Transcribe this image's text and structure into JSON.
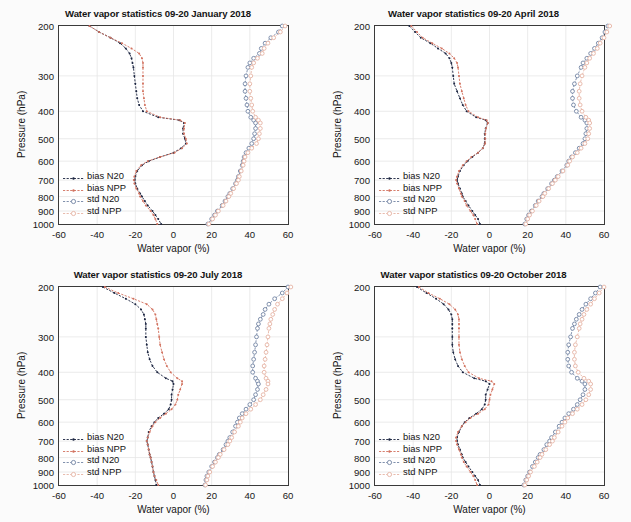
{
  "figure": {
    "xaxis_title": "Water vapor (%)",
    "yaxis_title": "Pressure (hPa)",
    "xticks": [
      "-60",
      "-40",
      "-20",
      "0",
      "20",
      "40",
      "60"
    ],
    "yticks": [
      "200",
      "300",
      "400",
      "500",
      "600",
      "700",
      "800",
      "900",
      "1000"
    ],
    "legend_labels": [
      "bias N20",
      "bias NPP",
      "std N20",
      "std NPP"
    ]
  },
  "colors": {
    "bias_n20": "#1b2440",
    "bias_npp": "#d2725f",
    "std_n20": "#7385a4",
    "std_npp": "#e5b3a4",
    "axis": "#3a3a3a",
    "grid": "#e6e6e6",
    "text": "#141414",
    "background": "#ffffff"
  },
  "chart_data": [
    {
      "type": "line",
      "title": "Water vapor statistics 09-20 January 2018",
      "xlabel": "Water vapor (%)",
      "ylabel": "Pressure (hPa)",
      "xlim": [
        -60,
        60
      ],
      "ylim": [
        200,
        1000
      ],
      "yscale": "log",
      "grid": true,
      "legend_position": "lower-left",
      "pressure": [
        200,
        210,
        220,
        230,
        240,
        250,
        260,
        270,
        280,
        300,
        320,
        340,
        360,
        380,
        400,
        420,
        430,
        440,
        460,
        480,
        500,
        520,
        540,
        560,
        580,
        600,
        620,
        650,
        680,
        700,
        720,
        750,
        780,
        800,
        830,
        860,
        900,
        930,
        960,
        1000
      ],
      "series": [
        {
          "name": "bias N20",
          "values": [
            -44,
            -39,
            -33,
            -28,
            -25,
            -23,
            -22,
            -21.5,
            -21,
            -20.5,
            -20,
            -19.5,
            -19,
            -18,
            -16,
            -8,
            3,
            5.5,
            5,
            5,
            6,
            6.5,
            4,
            0,
            -7,
            -13,
            -16.5,
            -19,
            -20,
            -20.3,
            -20,
            -19,
            -17.5,
            -16.5,
            -15,
            -13.5,
            -11,
            -9.5,
            -8,
            -6.5
          ]
        },
        {
          "name": "bias NPP",
          "values": [
            -44,
            -39,
            -33,
            -27,
            -22,
            -18,
            -16.5,
            -16,
            -16,
            -16,
            -16,
            -16,
            -15.5,
            -15,
            -14,
            -7,
            3.5,
            6,
            5.5,
            5.5,
            6.5,
            7,
            4.5,
            0.5,
            -7,
            -13.5,
            -17,
            -19.5,
            -20.5,
            -20.8,
            -20.5,
            -19.5,
            -18,
            -17.5,
            -16,
            -14.5,
            -12,
            -10.5,
            -9.5,
            -8.5
          ]
        },
        {
          "name": "std N20",
          "values": [
            57,
            55,
            51,
            48,
            46,
            45,
            42,
            40,
            39,
            38,
            37.5,
            37.5,
            38,
            38.5,
            39,
            40.5,
            42,
            43,
            43,
            42.5,
            42,
            41,
            39.5,
            38,
            37,
            36.5,
            36,
            35,
            34,
            33.5,
            32.5,
            31,
            29.5,
            28.5,
            27,
            25.5,
            23,
            21.5,
            20,
            18
          ]
        },
        {
          "name": "std NPP",
          "values": [
            58.5,
            56,
            52.5,
            49.5,
            47.5,
            46.5,
            44,
            42,
            41,
            40.5,
            40,
            40,
            40.5,
            41,
            41.5,
            43,
            44.5,
            45.5,
            45.5,
            45,
            44.5,
            43.5,
            41,
            39,
            37.5,
            37,
            36.5,
            35.5,
            34.5,
            34,
            33,
            31.5,
            30,
            29,
            27.5,
            26,
            23.5,
            22,
            20.5,
            18.5
          ]
        }
      ]
    },
    {
      "type": "line",
      "title": "Water vapor statistics 09-20 April 2018",
      "xlabel": "Water vapor (%)",
      "ylabel": "Pressure (hPa)",
      "xlim": [
        -60,
        60
      ],
      "ylim": [
        200,
        1000
      ],
      "yscale": "log",
      "grid": true,
      "legend_position": "lower-left",
      "pressure": [
        200,
        210,
        220,
        230,
        240,
        250,
        260,
        270,
        280,
        300,
        320,
        340,
        360,
        380,
        400,
        420,
        430,
        440,
        460,
        480,
        500,
        520,
        540,
        560,
        580,
        600,
        620,
        650,
        680,
        700,
        720,
        750,
        780,
        800,
        830,
        860,
        900,
        930,
        960,
        1000
      ],
      "series": [
        {
          "name": "bias N20",
          "values": [
            -42,
            -39,
            -36,
            -31,
            -27,
            -23,
            -21,
            -20,
            -19.5,
            -19,
            -18.5,
            -17,
            -15.5,
            -14,
            -12,
            -7,
            -2,
            -1,
            -2,
            -2.5,
            -2.5,
            -2.5,
            -3.5,
            -6,
            -9,
            -11.5,
            -13.5,
            -15.5,
            -16.5,
            -17,
            -16.5,
            -15.5,
            -14.5,
            -14,
            -12.5,
            -11,
            -9,
            -7.5,
            -6,
            -5
          ]
        },
        {
          "name": "bias NPP",
          "values": [
            -41,
            -38,
            -35,
            -30,
            -25,
            -21,
            -18.5,
            -17,
            -16.5,
            -16,
            -15.5,
            -14.5,
            -13.5,
            -12.5,
            -11,
            -6,
            -1.5,
            -0.8,
            -1.8,
            -2.2,
            -2.2,
            -2.3,
            -3.5,
            -6,
            -9.5,
            -12,
            -14,
            -16,
            -17,
            -17.5,
            -17,
            -16,
            -15,
            -14.5,
            -13,
            -12,
            -10,
            -8.5,
            -7.5,
            -6.5
          ]
        },
        {
          "name": "std N20",
          "values": [
            62,
            60.5,
            59,
            57,
            55,
            53,
            51,
            49,
            48,
            46,
            44.5,
            43.5,
            43.5,
            44,
            45.5,
            48,
            50,
            51,
            51,
            50.5,
            50,
            49,
            47,
            45,
            43,
            41.5,
            40.5,
            38,
            35.5,
            34,
            32.5,
            30.5,
            28.5,
            27.5,
            25.5,
            24,
            22,
            20.5,
            19.5,
            18.5
          ]
        },
        {
          "name": "std NPP",
          "values": [
            63,
            61.5,
            60,
            58,
            56.5,
            54.5,
            52.5,
            51,
            50,
            48.5,
            47.5,
            47,
            47,
            47.5,
            48.5,
            50.5,
            52,
            52.5,
            52.5,
            52,
            51.5,
            50,
            48,
            46,
            43.5,
            42,
            41,
            38.5,
            36,
            34.5,
            33,
            31,
            29,
            28,
            26,
            24.5,
            22.5,
            21,
            20,
            19
          ]
        }
      ]
    },
    {
      "type": "line",
      "title": "Water vapor statistics 09-20 July 2018",
      "xlabel": "Water vapor (%)",
      "ylabel": "Pressure (hPa)",
      "xlim": [
        -60,
        60
      ],
      "ylim": [
        200,
        1000
      ],
      "yscale": "log",
      "grid": true,
      "legend_position": "lower-left",
      "pressure": [
        200,
        210,
        220,
        230,
        240,
        250,
        260,
        270,
        280,
        300,
        320,
        340,
        360,
        380,
        400,
        420,
        430,
        440,
        460,
        480,
        500,
        520,
        540,
        560,
        580,
        600,
        620,
        650,
        680,
        700,
        720,
        750,
        780,
        800,
        830,
        860,
        900,
        930,
        960,
        1000
      ],
      "series": [
        {
          "name": "bias N20",
          "values": [
            -37,
            -31,
            -25,
            -20,
            -17,
            -15.5,
            -15,
            -14.5,
            -14.5,
            -14.5,
            -14,
            -13.5,
            -12.5,
            -11,
            -8.5,
            -4,
            -0.5,
            0,
            -0.5,
            -1,
            -1,
            -1.5,
            -2.5,
            -5,
            -8,
            -10,
            -11.5,
            -13,
            -13.5,
            -14,
            -13.5,
            -13,
            -12.5,
            -12,
            -11.5,
            -11,
            -10.5,
            -10,
            -9.5,
            -9
          ]
        },
        {
          "name": "bias NPP",
          "values": [
            -36,
            -29,
            -21,
            -14,
            -11,
            -9.5,
            -9,
            -8.5,
            -8,
            -7.5,
            -7,
            -6,
            -5,
            -3.5,
            -1.5,
            2,
            4.5,
            4.5,
            3.5,
            2.5,
            2,
            1,
            -1,
            -4,
            -7,
            -9.5,
            -11,
            -12.5,
            -13.5,
            -14,
            -13.5,
            -13,
            -12.5,
            -12,
            -11.5,
            -11,
            -10.5,
            -10,
            -9,
            -8
          ]
        },
        {
          "name": "std N20",
          "values": [
            60,
            57,
            53,
            50,
            48,
            47,
            45.5,
            44.5,
            44,
            43.5,
            43,
            42.5,
            42,
            41.5,
            41.5,
            43,
            44,
            44.5,
            44,
            43,
            42,
            40,
            38,
            36,
            34.5,
            33.5,
            32.5,
            31,
            29.5,
            28.5,
            27.5,
            26,
            24,
            23,
            21.5,
            20,
            18.5,
            17.5,
            17,
            16.5
          ]
        },
        {
          "name": "std NPP",
          "values": [
            61.5,
            59.5,
            57,
            54.5,
            53,
            52,
            51,
            50.5,
            50,
            49.5,
            49,
            48.5,
            48,
            47.5,
            47.5,
            48.5,
            49.5,
            49.5,
            48.5,
            47,
            45.5,
            43,
            40.5,
            38,
            36,
            35,
            34,
            32,
            30.5,
            29.5,
            28.5,
            26.5,
            24.5,
            23.5,
            22,
            20.5,
            19,
            18,
            17.5,
            16.8
          ]
        }
      ]
    },
    {
      "type": "line",
      "title": "Water vapor statistics 09-20 October 2018",
      "xlabel": "Water vapor (%)",
      "ylabel": "Pressure (hPa)",
      "xlim": [
        -60,
        60
      ],
      "ylim": [
        200,
        1000
      ],
      "yscale": "log",
      "grid": true,
      "legend_position": "lower-left",
      "pressure": [
        200,
        210,
        220,
        230,
        240,
        250,
        260,
        270,
        280,
        300,
        320,
        340,
        360,
        380,
        400,
        420,
        430,
        440,
        460,
        480,
        500,
        520,
        540,
        560,
        580,
        600,
        620,
        650,
        680,
        700,
        720,
        750,
        780,
        800,
        830,
        860,
        900,
        930,
        960,
        1000
      ],
      "series": [
        {
          "name": "bias N20",
          "values": [
            -38,
            -33,
            -28,
            -24,
            -21.5,
            -20,
            -19.5,
            -19.5,
            -19.5,
            -19.5,
            -19.5,
            -19,
            -18,
            -16.5,
            -14,
            -8,
            -2,
            0,
            -1,
            -2,
            -2,
            -2.5,
            -4,
            -7,
            -10.5,
            -13,
            -14.5,
            -16,
            -17,
            -17,
            -16.5,
            -15.5,
            -14.5,
            -14,
            -12.5,
            -11,
            -9,
            -7.5,
            -6,
            -5
          ]
        },
        {
          "name": "bias NPP",
          "values": [
            -37,
            -32,
            -26,
            -21,
            -18,
            -16.5,
            -16,
            -16,
            -16,
            -16,
            -16,
            -15.5,
            -14.5,
            -13,
            -11,
            -5.5,
            1,
            2.5,
            1.5,
            0.5,
            0,
            -0.5,
            -2.5,
            -6,
            -10,
            -12.5,
            -14.5,
            -16.5,
            -17.5,
            -17.5,
            -17,
            -16,
            -15,
            -14.5,
            -13.5,
            -12,
            -10,
            -8.5,
            -7.5,
            -6.5
          ]
        },
        {
          "name": "std N20",
          "values": [
            58,
            55.5,
            53,
            50.5,
            48.5,
            47,
            45.5,
            44.5,
            43.5,
            42.5,
            41.5,
            41,
            41,
            41.5,
            43,
            46,
            48.5,
            50,
            50,
            49,
            47.5,
            46,
            44,
            41.5,
            39.5,
            38,
            36.5,
            34.5,
            32.5,
            31.5,
            30,
            28.5,
            26.5,
            25.5,
            24,
            22.5,
            21,
            20,
            19,
            18
          ]
        },
        {
          "name": "std NPP",
          "values": [
            60,
            57.5,
            55,
            53,
            51,
            49.5,
            48.5,
            47.5,
            47,
            46,
            45,
            44.5,
            44.5,
            45,
            46.5,
            49.5,
            52,
            53,
            53,
            52,
            50.5,
            48.5,
            46,
            43.5,
            41,
            39.5,
            38,
            36,
            34,
            33,
            31.5,
            29.5,
            27.5,
            26.5,
            25,
            23.5,
            21.5,
            20.5,
            19.5,
            18.5
          ]
        }
      ]
    }
  ]
}
